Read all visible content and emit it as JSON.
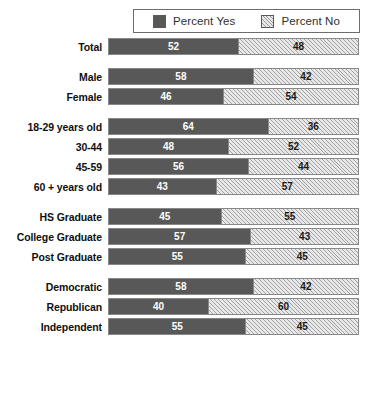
{
  "title": "",
  "legend": {
    "position": "top-center",
    "entries": [
      {
        "label": "Percent Yes",
        "swatch": "solid-dark-gray",
        "color": "#585858"
      },
      {
        "label": "Percent No",
        "swatch": "hatched-light-gray",
        "color": "#e8e8e8"
      }
    ]
  },
  "chart_data": {
    "type": "bar",
    "orientation": "horizontal",
    "stacked": true,
    "title": "",
    "subtitle": "",
    "xlabel": "",
    "ylabel": "",
    "xlim": [
      0,
      100
    ],
    "grid": false,
    "legend_position": "top-center",
    "value_labels": true,
    "units": "percent",
    "categories": [
      "Total",
      "Male",
      "Female",
      "18-29 years old",
      "30-44",
      "45-59",
      "60 + years old",
      "HS Graduate",
      "College Graduate",
      "Post Graduate",
      "Democratic",
      "Republican",
      "Independent"
    ],
    "series": [
      {
        "name": "Percent Yes",
        "color": "#585858",
        "values": [
          52,
          58,
          46,
          64,
          48,
          56,
          43,
          45,
          57,
          55,
          58,
          40,
          55
        ]
      },
      {
        "name": "Percent No",
        "color": "#e8e8e8",
        "values": [
          48,
          42,
          54,
          36,
          52,
          44,
          57,
          55,
          43,
          45,
          42,
          60,
          45
        ]
      }
    ],
    "groups": [
      {
        "name": "overall",
        "rows": [
          {
            "label": "Total",
            "yes": 52,
            "no": 48
          }
        ]
      },
      {
        "name": "gender",
        "rows": [
          {
            "label": "Male",
            "yes": 58,
            "no": 42
          },
          {
            "label": "Female",
            "yes": 46,
            "no": 54
          }
        ]
      },
      {
        "name": "age",
        "rows": [
          {
            "label": "18-29 years old",
            "yes": 64,
            "no": 36
          },
          {
            "label": "30-44",
            "yes": 48,
            "no": 52
          },
          {
            "label": "45-59",
            "yes": 56,
            "no": 44
          },
          {
            "label": "60 + years old",
            "yes": 43,
            "no": 57
          }
        ]
      },
      {
        "name": "education",
        "rows": [
          {
            "label": "HS Graduate",
            "yes": 45,
            "no": 55
          },
          {
            "label": "College Graduate",
            "yes": 57,
            "no": 43
          },
          {
            "label": "Post Graduate",
            "yes": 55,
            "no": 45
          }
        ]
      },
      {
        "name": "party",
        "rows": [
          {
            "label": "Democratic",
            "yes": 58,
            "no": 42
          },
          {
            "label": "Republican",
            "yes": 40,
            "no": 60
          },
          {
            "label": "Independent",
            "yes": 55,
            "no": 45
          }
        ]
      }
    ]
  }
}
